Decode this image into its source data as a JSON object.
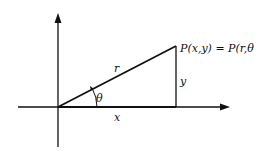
{
  "diagram": {
    "labels": {
      "point": "P(x,y) = P(r,θ)",
      "hypotenuse": "r",
      "vertical_side": "y",
      "horizontal_side": "x",
      "angle": "θ"
    },
    "colors": {
      "stroke": "#111111",
      "background": "#ffffff"
    }
  }
}
